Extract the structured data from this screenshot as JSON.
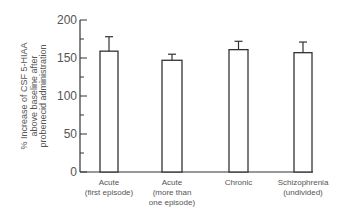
{
  "chart_data": {
    "type": "bar",
    "title": "",
    "xlabel": "",
    "ylabel": "% Increase of CSF 5-HIAA above baseline after probenecid administration",
    "ylabel_lines": [
      "% Increase of CSF 5-HIAA",
      "above baseline after",
      "probenecid administration"
    ],
    "ylim": [
      0,
      200
    ],
    "yticks": [
      0,
      50,
      100,
      150,
      200
    ],
    "yminor_ticks": [
      25,
      75,
      125,
      175
    ],
    "grid": false,
    "legend": null,
    "categories": [
      "Acute (first episode)",
      "Acute (more than one episode)",
      "Chronic",
      "Schizophrenia (undivided)"
    ],
    "category_lines": [
      [
        "Acute",
        "(first episode)"
      ],
      [
        "Acute",
        "(more than",
        "one episode)"
      ],
      [
        "Chronic"
      ],
      [
        "Schizophrenia",
        "(undivided)"
      ]
    ],
    "values": [
      159,
      147,
      161,
      157
    ],
    "error_upper": [
      178,
      155,
      172,
      171
    ],
    "bar_fill": "#ffffff",
    "bar_stroke": "#333333"
  }
}
